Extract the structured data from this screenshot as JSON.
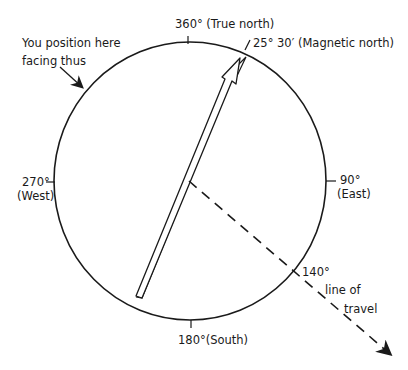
{
  "diagram": {
    "labels": {
      "north": "360° (True north)",
      "magnetic": "25° 30′ (Magnetic north)",
      "position_line1": "You position here",
      "position_line2": "facing thus",
      "west_deg": "270°",
      "west_name": "(West)",
      "east_deg": "90°",
      "east_name": "(East)",
      "south": "180°(South)",
      "bearing": "140°",
      "travel_line1": "line of",
      "travel_line2": "travel"
    },
    "bearings": {
      "true_north_deg": 360,
      "magnetic_north_deg": 25.5,
      "line_of_travel_deg": 140
    },
    "colors": {
      "stroke": "#1a1a1a",
      "background": "#ffffff"
    }
  }
}
